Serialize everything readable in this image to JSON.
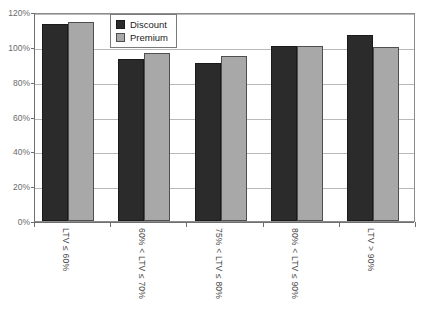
{
  "chart_data": {
    "type": "bar",
    "title": "",
    "xlabel": "",
    "ylabel": "",
    "ylim": [
      0,
      120
    ],
    "ytick_labels": [
      "120%",
      "100%",
      "80%",
      "60%",
      "40%",
      "20%",
      "0%"
    ],
    "ytick_values": [
      120,
      100,
      80,
      60,
      40,
      20,
      0
    ],
    "grid": true,
    "legend_position": "top-center",
    "categories": [
      "LTV ≤ 60%",
      "60% < LTV ≤ 70%",
      "75% < LTV ≤ 80%",
      "80% < LTV ≤ 90%",
      "LTV > 90%"
    ],
    "series": [
      {
        "name": "Discount",
        "color": "#2b2b2b",
        "values": [
          113,
          93,
          91,
          100.5,
          107
        ]
      },
      {
        "name": "Premium",
        "color": "#a8a8a8",
        "values": [
          114,
          96.5,
          95,
          100.5,
          100
        ]
      }
    ]
  },
  "legend": {
    "items": [
      {
        "label": "Discount",
        "swatch": "discount"
      },
      {
        "label": "Premium",
        "swatch": "premium"
      }
    ]
  }
}
